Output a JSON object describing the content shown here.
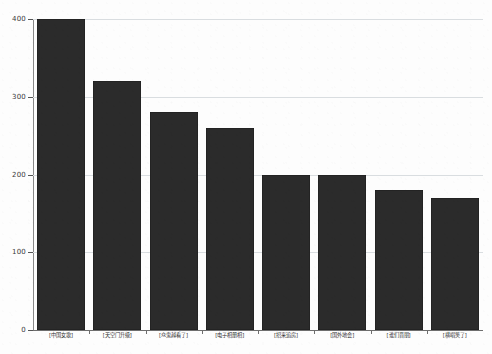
{
  "chart_data": {
    "type": "bar",
    "title": "",
    "subtitle": "",
    "xlabel": "",
    "ylabel": "",
    "ylim": [
      0,
      400
    ],
    "yticks": [
      0,
      100,
      200,
      300,
      400
    ],
    "grid": true,
    "legend": null,
    "bar_color": "#2b2b2b",
    "gridline_color": "#d9dde0",
    "axis_color": "#6e6e6e",
    "background_color": "#fdfdfd",
    "categories": [
      "[中国女歌]",
      "[天空门升级]",
      "[众鬼越看了]",
      "[电子相册相]",
      "[招来追房]",
      "[国外地会]",
      "[谁们晋朋]",
      "[横唱笑了]"
    ],
    "values": [
      400,
      320,
      280,
      260,
      200,
      200,
      180,
      170
    ]
  }
}
